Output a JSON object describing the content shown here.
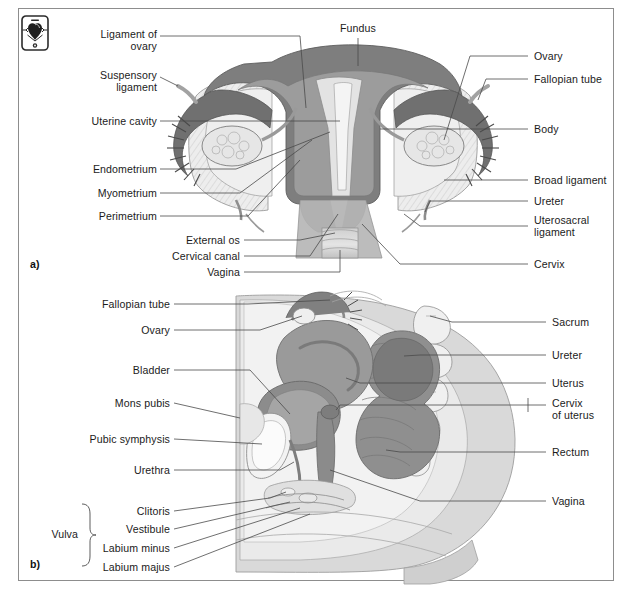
{
  "figure": {
    "caption": "",
    "frame_color": "#8d8d8d",
    "background": "#ffffff"
  },
  "icon": {
    "name": "device-anatomy-icon",
    "description": "small boxed device icon with dark organ silhouette"
  },
  "panels": [
    {
      "id": "a",
      "label": "a)",
      "x": 30,
      "y": 258
    },
    {
      "id": "b",
      "label": "b)",
      "x": 30,
      "y": 560
    }
  ],
  "panel_a": {
    "top_labels": [
      {
        "text": "Fundus",
        "x": 358,
        "y": 22,
        "align": "c"
      }
    ],
    "left_labels": [
      {
        "text": "Ligament of\novary",
        "x": 62,
        "y": 28,
        "w": 95,
        "align": "r"
      },
      {
        "text": "Suspensory\nligament",
        "x": 62,
        "y": 69,
        "w": 95,
        "align": "r"
      },
      {
        "text": "Uterine cavity",
        "x": 52,
        "y": 116,
        "w": 105,
        "align": "r"
      },
      {
        "text": "Endometrium",
        "x": 52,
        "y": 164,
        "w": 105,
        "align": "r"
      },
      {
        "text": "Myometrium",
        "x": 52,
        "y": 188,
        "w": 105,
        "align": "r"
      },
      {
        "text": "Perimetrium",
        "x": 52,
        "y": 211,
        "w": 105,
        "align": "r"
      },
      {
        "text": "External os",
        "x": 130,
        "y": 236,
        "w": 110,
        "align": "r"
      },
      {
        "text": "Cervical canal",
        "x": 130,
        "y": 252,
        "w": 110,
        "align": "r"
      },
      {
        "text": "Vagina",
        "x": 130,
        "y": 268,
        "w": 110,
        "align": "r"
      }
    ],
    "right_labels": [
      {
        "text": "Ovary",
        "x": 534,
        "y": 52,
        "align": "l"
      },
      {
        "text": "Fallopian tube",
        "x": 534,
        "y": 75,
        "align": "l"
      },
      {
        "text": "Body",
        "x": 534,
        "y": 125,
        "align": "l"
      },
      {
        "text": "Broad ligament",
        "x": 534,
        "y": 176,
        "align": "l"
      },
      {
        "text": "Ureter",
        "x": 534,
        "y": 197,
        "align": "l"
      },
      {
        "text": "Uterosacral\nligament",
        "x": 534,
        "y": 218,
        "align": "l"
      },
      {
        "text": "Cervix",
        "x": 534,
        "y": 260,
        "align": "l"
      }
    ]
  },
  "panel_b": {
    "left_labels": [
      {
        "text": "Fallopian tube",
        "x": 90,
        "y": 300,
        "w": 80,
        "align": "r"
      },
      {
        "text": "Ovary",
        "x": 90,
        "y": 326,
        "w": 80,
        "align": "r"
      },
      {
        "text": "Bladder",
        "x": 90,
        "y": 366,
        "w": 80,
        "align": "r"
      },
      {
        "text": "Mons pubis",
        "x": 80,
        "y": 399,
        "w": 90,
        "align": "r"
      },
      {
        "text": "Pubic symphysis",
        "x": 68,
        "y": 435,
        "w": 102,
        "align": "r"
      },
      {
        "text": "Urethra",
        "x": 90,
        "y": 466,
        "w": 80,
        "align": "r"
      },
      {
        "text": "Clitoris",
        "x": 90,
        "y": 507,
        "w": 80,
        "align": "r"
      },
      {
        "text": "Vestibule",
        "x": 90,
        "y": 525,
        "w": 80,
        "align": "r"
      },
      {
        "text": "Labium minus",
        "x": 82,
        "y": 544,
        "w": 88,
        "align": "r"
      },
      {
        "text": "Labium majus",
        "x": 82,
        "y": 563,
        "w": 88,
        "align": "r"
      }
    ],
    "bracket_group": {
      "label": "Vulva",
      "x": 34,
      "y": 530,
      "members": [
        "Clitoris",
        "Vestibule",
        "Labium minus",
        "Labium majus"
      ]
    },
    "right_labels": [
      {
        "text": "Sacrum",
        "x": 552,
        "y": 318,
        "align": "l"
      },
      {
        "text": "Ureter",
        "x": 552,
        "y": 351,
        "align": "l"
      },
      {
        "text": "Uterus",
        "x": 552,
        "y": 379,
        "align": "l"
      },
      {
        "text": "Cervix\nof uterus",
        "x": 552,
        "y": 399,
        "align": "l"
      },
      {
        "text": "Rectum",
        "x": 552,
        "y": 448,
        "align": "l"
      },
      {
        "text": "Vagina",
        "x": 552,
        "y": 497,
        "align": "l"
      }
    ]
  },
  "colors": {
    "line": "#3a3a3a",
    "leader": "#4a4a4a",
    "dark_gray": "#7b7b7b",
    "mid_gray": "#9d9d9d",
    "light_gray": "#d6d6d6",
    "pale_gray": "#e9e9e9",
    "very_pale": "#f2f2f2",
    "outline": "#6b6b6b",
    "text": "#1b1b1b"
  }
}
